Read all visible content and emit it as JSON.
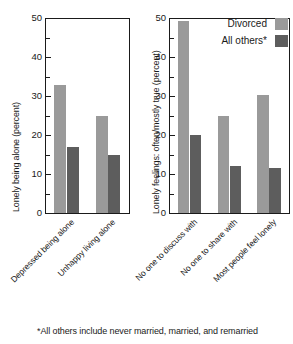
{
  "figure": {
    "footnote": "*All others include never married, married, and remarried"
  },
  "legend": {
    "position": "top-right-of-right-panel",
    "entries": [
      {
        "label": "Divorced",
        "color": "#9a9a9a"
      },
      {
        "label": "All others*",
        "color": "#5d5d5d"
      }
    ]
  },
  "chart_data": [
    {
      "type": "bar",
      "title": "",
      "panel": "left",
      "xlabel": "",
      "ylabel": "Lonely being alone (percent)",
      "ylim": [
        0,
        50
      ],
      "ytick_major": [
        0,
        10,
        20,
        30,
        40,
        50
      ],
      "ytick_minor_step": 5,
      "ytick_labels": [
        "0",
        "10",
        "20",
        "30",
        "40",
        "50"
      ],
      "grid": false,
      "categories": [
        "Depressed being alone",
        "Unhappy living alone"
      ],
      "series": [
        {
          "name": "Divorced",
          "color": "#9a9a9a",
          "values": [
            33,
            25
          ]
        },
        {
          "name": "All others*",
          "color": "#5d5d5d",
          "values": [
            17,
            15
          ]
        }
      ]
    },
    {
      "type": "bar",
      "title": "",
      "panel": "right",
      "xlabel": "",
      "ylabel": "Lonely feelings: often/mostly true (percent)",
      "ylim": [
        0,
        50
      ],
      "ytick_major": [
        0,
        10,
        20,
        30,
        40,
        50
      ],
      "ytick_minor_step": 5,
      "ytick_labels": [
        "0",
        "10",
        "20",
        "30",
        "40",
        "50"
      ],
      "grid": false,
      "categories": [
        "No one to discuss with",
        "No one to share with",
        "Most people feel lonely"
      ],
      "series": [
        {
          "name": "Divorced",
          "color": "#9a9a9a",
          "values": [
            49.5,
            25,
            30.5
          ]
        },
        {
          "name": "All others*",
          "color": "#5d5d5d",
          "values": [
            20,
            12,
            11.5
          ]
        }
      ]
    }
  ]
}
